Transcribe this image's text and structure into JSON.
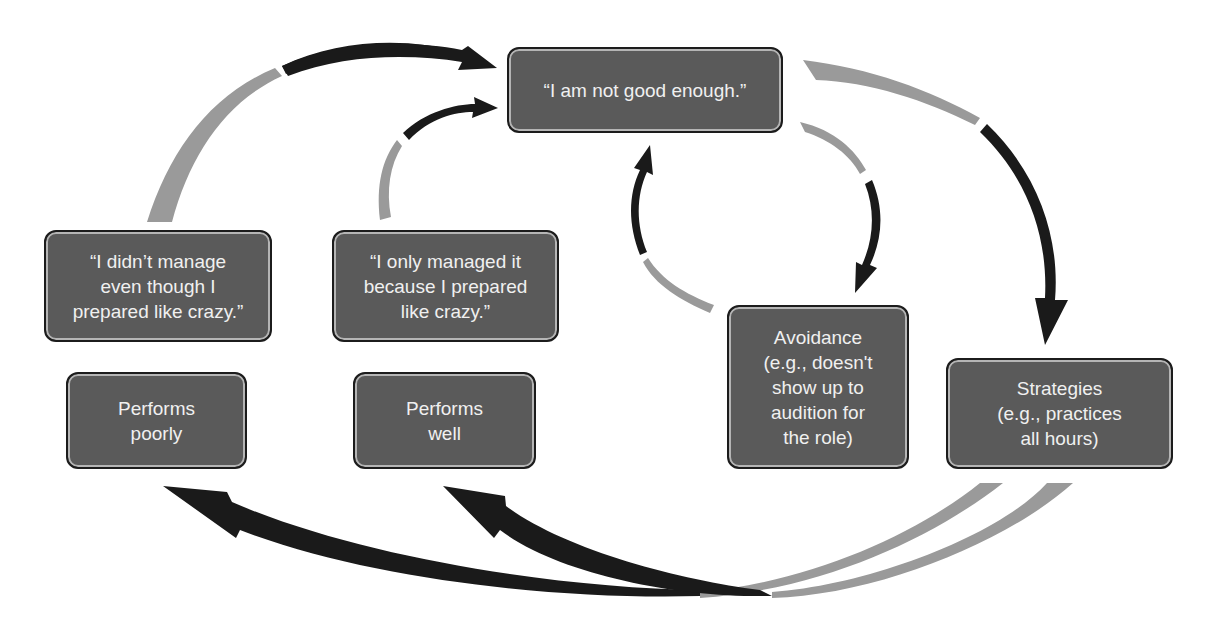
{
  "diagram": {
    "nodes": {
      "core_belief": {
        "label": "“I am not good enough.”"
      },
      "attribution_fail": {
        "label": "“I didn’t manage\neven though I\nprepared like crazy.”"
      },
      "attribution_success": {
        "label": "“I only managed it\nbecause I prepared\nlike crazy.”"
      },
      "performs_poorly": {
        "label": "Performs\npoorly"
      },
      "performs_well": {
        "label": "Performs\nwell"
      },
      "avoidance": {
        "label": "Avoidance\n(e.g., doesn't\nshow up to\naudition for\nthe role)"
      },
      "strategies": {
        "label": "Strategies\n(e.g., practices\nall hours)"
      }
    },
    "edges": [
      {
        "from": "attribution_fail",
        "to": "core_belief"
      },
      {
        "from": "attribution_success",
        "to": "core_belief"
      },
      {
        "from": "core_belief",
        "to": "avoidance"
      },
      {
        "from": "avoidance",
        "to": "core_belief"
      },
      {
        "from": "core_belief",
        "to": "strategies"
      },
      {
        "from": "strategies",
        "to": "performs_poorly"
      },
      {
        "from": "strategies",
        "to": "performs_well"
      }
    ],
    "colors": {
      "box_fill": "#5a5a5a",
      "box_border": "#1c1c1c",
      "arrow_dark": "#1a1a1a",
      "arrow_light": "#9a9a9a",
      "text": "#f0f0f0"
    }
  }
}
